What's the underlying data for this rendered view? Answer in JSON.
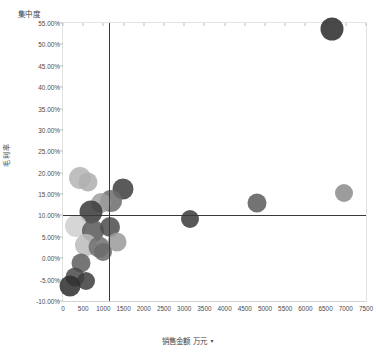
{
  "chart_data": {
    "type": "scatter",
    "title": "集中度",
    "xlabel": "销售金额 万元",
    "ylabel": "毛利率",
    "xlim": [
      0,
      7500
    ],
    "ylim": [
      -10,
      55
    ],
    "grid": false,
    "legend": null,
    "x_ticks": [
      "0",
      "500",
      "1000",
      "1500",
      "2000",
      "2500",
      "3000",
      "3500",
      "4000",
      "4500",
      "5000",
      "5500",
      "6000",
      "6500",
      "7000",
      "7500"
    ],
    "x_tick_values": [
      0,
      500,
      1000,
      1500,
      2000,
      2500,
      3000,
      3500,
      4000,
      4500,
      5000,
      5500,
      6000,
      6500,
      7000,
      7500
    ],
    "y_ticks": [
      "55.00%",
      "50.00%",
      "45.00%",
      "40.00%",
      "35.00%",
      "30.00%",
      "25.00%",
      "20.00%",
      "15.00%",
      "10.00%",
      "5.00%",
      "0.00%",
      "-5.00%",
      "-10.00%"
    ],
    "y_tick_values": [
      55,
      50,
      45,
      40,
      35,
      30,
      25,
      20,
      15,
      10,
      5,
      0,
      -5,
      -10
    ],
    "reference_lines": {
      "vertical_x": 1150,
      "horizontal_y": 10.0
    },
    "points": [
      {
        "x": 6650,
        "y": 53.5,
        "r": 11.5,
        "color": "#2b2b2b"
      },
      {
        "x": 6950,
        "y": 15.2,
        "r": 9.0,
        "color": "#8c8c8c"
      },
      {
        "x": 4800,
        "y": 12.8,
        "r": 9.5,
        "color": "#5c5c5c"
      },
      {
        "x": 3150,
        "y": 9.2,
        "r": 9.0,
        "color": "#3c3c3c"
      },
      {
        "x": 1480,
        "y": 16.2,
        "r": 10.5,
        "color": "#3f3f3f"
      },
      {
        "x": 1180,
        "y": 13.4,
        "r": 11.0,
        "color": "#6e6e6e"
      },
      {
        "x": 930,
        "y": 13.0,
        "r": 10.0,
        "color": "#a0a0a0"
      },
      {
        "x": 410,
        "y": 18.8,
        "r": 11.0,
        "color": "#b5b5b5"
      },
      {
        "x": 620,
        "y": 17.8,
        "r": 9.5,
        "color": "#b0b0b0"
      },
      {
        "x": 690,
        "y": 10.8,
        "r": 11.5,
        "color": "#3a3a3a"
      },
      {
        "x": 330,
        "y": 7.6,
        "r": 11.0,
        "color": "#cfcfcf"
      },
      {
        "x": 740,
        "y": 6.4,
        "r": 11.0,
        "color": "#5a5a5a"
      },
      {
        "x": 1160,
        "y": 7.4,
        "r": 10.0,
        "color": "#4e4e4e"
      },
      {
        "x": 1340,
        "y": 3.9,
        "r": 9.5,
        "color": "#9a9a9a"
      },
      {
        "x": 560,
        "y": 3.2,
        "r": 11.0,
        "color": "#bcbcbc"
      },
      {
        "x": 880,
        "y": 2.6,
        "r": 10.5,
        "color": "#707070"
      },
      {
        "x": 1000,
        "y": 1.4,
        "r": 9.0,
        "color": "#6a6a6a"
      },
      {
        "x": 450,
        "y": -1.2,
        "r": 9.5,
        "color": "#5f5f5f"
      },
      {
        "x": 290,
        "y": -4.3,
        "r": 9.5,
        "color": "#4b4b4b"
      },
      {
        "x": 560,
        "y": -5.4,
        "r": 9.0,
        "color": "#3e3e3e"
      },
      {
        "x": 180,
        "y": -6.4,
        "r": 10.5,
        "color": "#2e2e2e"
      }
    ]
  },
  "axis_controls": {
    "x_dropdown_caret": "▾"
  }
}
